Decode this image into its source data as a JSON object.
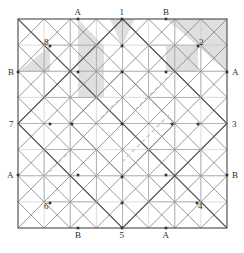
{
  "figure": {
    "name": "geometric-grid-diagram",
    "type": "line-diagram",
    "square": {
      "x0": 18,
      "y0": 19,
      "x1": 227,
      "y1": 228,
      "size": 209
    },
    "divisions": 8,
    "colors": {
      "line_dark": "#555555",
      "line_mid": "#777777",
      "line_light": "#aaaaaa",
      "line_faint": "#c4c4c4",
      "shade_fill": "#d9d9d9",
      "dash": "#c9c9c9",
      "text": "#2b2b2b",
      "dot": "#333333"
    },
    "edge_labels": {
      "top": [
        {
          "text": "A",
          "x": 78,
          "y": 19
        },
        {
          "text": "1",
          "x": 122,
          "y": 19
        },
        {
          "text": "B",
          "x": 166,
          "y": 19
        }
      ],
      "bottom": [
        {
          "text": "B",
          "x": 78,
          "y": 228
        },
        {
          "text": "5",
          "x": 122,
          "y": 228
        },
        {
          "text": "A",
          "x": 166,
          "y": 228
        }
      ],
      "left": [
        {
          "text": "B",
          "x": 18,
          "y": 72
        },
        {
          "text": "7",
          "x": 18,
          "y": 124
        },
        {
          "text": "A",
          "x": 18,
          "y": 175
        }
      ],
      "right": [
        {
          "text": "A",
          "x": 227,
          "y": 72
        },
        {
          "text": "3",
          "x": 227,
          "y": 124
        },
        {
          "text": "B",
          "x": 227,
          "y": 175
        }
      ]
    },
    "interior_labels": [
      {
        "text": "8",
        "x": 50,
        "y": 46,
        "corner": "top-left"
      },
      {
        "text": "2",
        "x": 198,
        "y": 46,
        "corner": "top-right"
      },
      {
        "text": "6",
        "x": 50,
        "y": 203,
        "corner": "bottom-left"
      },
      {
        "text": "4",
        "x": 197,
        "y": 203,
        "corner": "bottom-right"
      }
    ],
    "shaded_regions": [
      {
        "name": "triangle-near-8",
        "points": "18,72 50,46 50,72"
      },
      {
        "name": "band-left-of-A-top",
        "points": "78,19 104,46 104,97 78,97"
      },
      {
        "name": "sliver-near-1",
        "points": "110,19 122,19 122,46"
      },
      {
        "name": "sliver-right-of-1",
        "points": "122,19 135,19 122,46"
      },
      {
        "name": "block-near-2",
        "points": "166,46 198,46 198,72 166,72"
      },
      {
        "name": "wedge-top-right",
        "points": "166,19 227,19 227,72 198,46"
      }
    ],
    "dashed_segments": [
      {
        "x1": 135,
        "y1": 110,
        "x2": 205,
        "y2": 40
      },
      {
        "x1": 122,
        "y1": 162,
        "x2": 172,
        "y2": 112
      },
      {
        "x1": 44,
        "y1": 177,
        "x2": 70,
        "y2": 151
      },
      {
        "x1": 96,
        "y1": 123,
        "x2": 122,
        "y2": 97
      }
    ],
    "vertex_dots": [
      {
        "x": 78,
        "y": 19
      },
      {
        "x": 122,
        "y": 19
      },
      {
        "x": 166,
        "y": 19
      },
      {
        "x": 78,
        "y": 228
      },
      {
        "x": 122,
        "y": 228
      },
      {
        "x": 166,
        "y": 228
      },
      {
        "x": 18,
        "y": 72
      },
      {
        "x": 18,
        "y": 175
      },
      {
        "x": 227,
        "y": 72
      },
      {
        "x": 227,
        "y": 175
      },
      {
        "x": 50,
        "y": 46
      },
      {
        "x": 198,
        "y": 46
      },
      {
        "x": 50,
        "y": 203
      },
      {
        "x": 197,
        "y": 203
      },
      {
        "x": 122,
        "y": 46
      },
      {
        "x": 122,
        "y": 72
      },
      {
        "x": 122,
        "y": 124
      },
      {
        "x": 122,
        "y": 177
      },
      {
        "x": 122,
        "y": 203
      },
      {
        "x": 50,
        "y": 124
      },
      {
        "x": 72,
        "y": 124
      },
      {
        "x": 172,
        "y": 124
      },
      {
        "x": 198,
        "y": 124
      },
      {
        "x": 78,
        "y": 72
      },
      {
        "x": 166,
        "y": 72
      },
      {
        "x": 78,
        "y": 175
      },
      {
        "x": 166,
        "y": 175
      }
    ]
  },
  "chart_data": {
    "type": "line-diagram",
    "title": "",
    "categories": [
      "A",
      "1",
      "B",
      "3",
      "A",
      "5",
      "B",
      "7"
    ],
    "corner_markers": [
      "2",
      "4",
      "6",
      "8"
    ],
    "values": [
      1,
      2,
      3,
      4,
      5,
      6,
      7,
      8
    ],
    "xlabel": "",
    "ylabel": "",
    "grid": true,
    "legend": "none"
  }
}
